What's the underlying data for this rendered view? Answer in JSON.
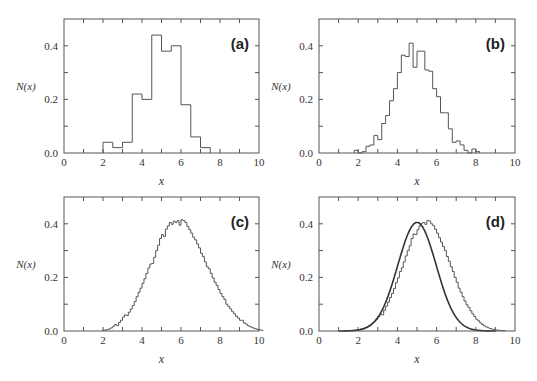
{
  "figure": {
    "style": {
      "line_color": "#555555",
      "curve_color": "#333333",
      "text_color": "#333333"
    }
  },
  "chart_data": [
    {
      "id": "a",
      "type": "histogram",
      "panel_label": "(a)",
      "xlabel": "x",
      "ylabel": "N(x)",
      "xlim": [
        0,
        10
      ],
      "ylim": [
        0,
        0.5
      ],
      "x_ticks": [
        0,
        2,
        4,
        6,
        8,
        10
      ],
      "x_tick_labels": [
        "0",
        "2",
        "4",
        "6",
        "8",
        "10"
      ],
      "y_ticks": [
        0.0,
        0.2,
        0.4
      ],
      "y_tick_labels": [
        "0.0",
        "0.2",
        "0.4"
      ],
      "bin_start": 2.0,
      "bin_width": 0.5,
      "values": [
        0.04,
        0.02,
        0.04,
        0.22,
        0.2,
        0.44,
        0.38,
        0.4,
        0.18,
        0.06,
        0.02
      ],
      "frame": {
        "x": 64,
        "y": 19,
        "w": 195,
        "h": 134
      }
    },
    {
      "id": "b",
      "type": "histogram",
      "panel_label": "(b)",
      "xlabel": "x",
      "ylabel": "N(x)",
      "xlim": [
        0,
        10
      ],
      "ylim": [
        0,
        0.5
      ],
      "x_ticks": [
        0,
        2,
        4,
        6,
        8,
        10
      ],
      "x_tick_labels": [
        "0",
        "2",
        "4",
        "6",
        "8",
        "10"
      ],
      "y_ticks": [
        0.0,
        0.2,
        0.4
      ],
      "y_tick_labels": [
        "0.0",
        "0.2",
        "0.4"
      ],
      "bin_start": 1.8,
      "bin_width": 0.2,
      "values": [
        0.01,
        0.0,
        0.005,
        0.025,
        0.03,
        0.065,
        0.05,
        0.11,
        0.14,
        0.195,
        0.24,
        0.3,
        0.365,
        0.36,
        0.41,
        0.32,
        0.38,
        0.38,
        0.31,
        0.305,
        0.24,
        0.21,
        0.15,
        0.15,
        0.09,
        0.04,
        0.045,
        0.03,
        0.01,
        0.0,
        0.015,
        0.005
      ],
      "frame": {
        "x": 319,
        "y": 19,
        "w": 196,
        "h": 134
      }
    },
    {
      "id": "c",
      "type": "histogram",
      "panel_label": "(c)",
      "xlabel": "x",
      "ylabel": "N(x)",
      "xlim": [
        0,
        10
      ],
      "ylim": [
        0,
        0.5
      ],
      "x_ticks": [
        0,
        2,
        4,
        6,
        8,
        10
      ],
      "x_tick_labels": [
        "0",
        "2",
        "4",
        "6",
        "8",
        "10"
      ],
      "y_ticks": [
        0.0,
        0.2,
        0.4
      ],
      "y_tick_labels": [
        "0.0",
        "0.2",
        "0.4"
      ],
      "bin_start": 2.0,
      "bin_width": 0.1,
      "values": [
        0.003,
        0.004,
        0.006,
        0.008,
        0.012,
        0.018,
        0.024,
        0.02,
        0.032,
        0.04,
        0.052,
        0.06,
        0.058,
        0.07,
        0.082,
        0.095,
        0.11,
        0.128,
        0.145,
        0.16,
        0.178,
        0.195,
        0.215,
        0.235,
        0.25,
        0.252,
        0.275,
        0.3,
        0.32,
        0.345,
        0.36,
        0.352,
        0.38,
        0.392,
        0.405,
        0.398,
        0.41,
        0.405,
        0.412,
        0.395,
        0.415,
        0.412,
        0.405,
        0.39,
        0.378,
        0.365,
        0.35,
        0.34,
        0.325,
        0.31,
        0.29,
        0.278,
        0.258,
        0.24,
        0.232,
        0.215,
        0.198,
        0.182,
        0.17,
        0.155,
        0.14,
        0.128,
        0.118,
        0.1,
        0.092,
        0.082,
        0.072,
        0.064,
        0.055,
        0.048,
        0.04,
        0.04,
        0.03,
        0.026,
        0.02,
        0.016,
        0.014,
        0.01,
        0.008,
        0.006,
        0.004,
        0.003
      ],
      "frame": {
        "x": 64,
        "y": 197,
        "w": 195,
        "h": 134
      }
    },
    {
      "id": "d",
      "type": "histogram+line",
      "panel_label": "(d)",
      "xlabel": "x",
      "ylabel": "N(x)",
      "xlim": [
        0,
        10
      ],
      "ylim": [
        0,
        0.5
      ],
      "x_ticks": [
        0,
        2,
        4,
        6,
        8,
        10
      ],
      "x_tick_labels": [
        "0",
        "2",
        "4",
        "6",
        "8",
        "10"
      ],
      "y_ticks": [
        0.0,
        0.2,
        0.4
      ],
      "y_tick_labels": [
        "0.0",
        "0.2",
        "0.4"
      ],
      "bin_start": 1.5,
      "bin_width": 0.1,
      "values": [
        0.001,
        0.002,
        0.002,
        0.003,
        0.004,
        0.005,
        0.007,
        0.009,
        0.012,
        0.015,
        0.019,
        0.024,
        0.03,
        0.036,
        0.044,
        0.054,
        0.063,
        0.06,
        0.078,
        0.093,
        0.108,
        0.125,
        0.14,
        0.158,
        0.18,
        0.198,
        0.222,
        0.236,
        0.258,
        0.28,
        0.3,
        0.318,
        0.345,
        0.362,
        0.36,
        0.378,
        0.392,
        0.402,
        0.405,
        0.398,
        0.412,
        0.41,
        0.4,
        0.393,
        0.38,
        0.365,
        0.348,
        0.332,
        0.315,
        0.3,
        0.278,
        0.26,
        0.24,
        0.222,
        0.2,
        0.182,
        0.16,
        0.145,
        0.128,
        0.112,
        0.098,
        0.088,
        0.075,
        0.064,
        0.054,
        0.044,
        0.038,
        0.03,
        0.024,
        0.019,
        0.015,
        0.012,
        0.009,
        0.007,
        0.005,
        0.004,
        0.003,
        0.002,
        0.002,
        0.001
      ],
      "curve": {
        "type": "gaussian",
        "mean": 5.0,
        "sigma": 0.98,
        "amplitude": 0.405,
        "x_range": [
          1.0,
          9.0
        ]
      },
      "frame": {
        "x": 319,
        "y": 197,
        "w": 196,
        "h": 134
      }
    }
  ]
}
